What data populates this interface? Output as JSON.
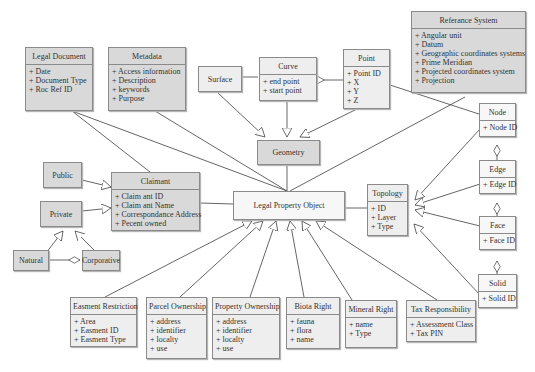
{
  "diagram": {
    "type": "UML class diagram",
    "classes": {
      "legal_document": {
        "name": "Legal Document",
        "attributes": [
          "+ Date",
          "+ Document Type",
          "+ Roc Ref ID"
        ]
      },
      "metadata": {
        "name": "Metadata",
        "attributes": [
          "+ Access information",
          "+ Description",
          "+ keywords",
          "+ Purpose"
        ]
      },
      "surface": {
        "name": "Surface",
        "attributes": []
      },
      "curve": {
        "name": "Curve",
        "attributes": [
          "+ end point",
          "+ start point"
        ]
      },
      "point": {
        "name": "Point",
        "attributes": [
          "+ Point ID",
          "+ X",
          "+ Y",
          "+ Z"
        ]
      },
      "reference_system": {
        "name": "Referance System",
        "attributes": [
          "+ Angular unit",
          "+ Datum",
          "+ Geographic coordinates systems",
          "+ Prime Meridian",
          "+ Projected coordinates system",
          "+ Projection"
        ]
      },
      "node": {
        "name": "Node",
        "attributes": [
          "+ Node ID"
        ]
      },
      "edge": {
        "name": "Edge",
        "attributes": [
          "+ Edge ID"
        ]
      },
      "face": {
        "name": "Face",
        "attributes": [
          "+ Face ID"
        ]
      },
      "solid": {
        "name": "Solid",
        "attributes": [
          "+ Solid ID"
        ]
      },
      "geometry": {
        "name": "Geometry",
        "attributes": []
      },
      "topology": {
        "name": "Topology",
        "attributes": [
          "+ ID",
          "+ Layer",
          "+ Type"
        ]
      },
      "public": {
        "name": "Public",
        "attributes": []
      },
      "private": {
        "name": "Private",
        "attributes": []
      },
      "natural": {
        "name": "Natural",
        "attributes": []
      },
      "corporative": {
        "name": "Corporative",
        "attributes": []
      },
      "claimant": {
        "name": "Claimant",
        "attributes": [
          "+ Claim ant ID",
          "+ Claim ant Name",
          "+ Correspondance Address",
          "+ Pecent owned"
        ]
      },
      "legal_property_object": {
        "name": "Legal Property Object",
        "attributes": []
      },
      "easement_restriction": {
        "name": "Easment Restriction",
        "attributes": [
          "+ Area",
          "+ Easment ID",
          "+ Easment Type"
        ]
      },
      "parcel_ownership": {
        "name": "Parcel Ownership",
        "attributes": [
          "+ address",
          "+ identifier",
          "+ localty",
          "+ use"
        ]
      },
      "property_ownership": {
        "name": "Property Ownership",
        "attributes": [
          "+ address",
          "+ identifier",
          "+ localty",
          "+ use"
        ]
      },
      "biota_right": {
        "name": "Biota Right",
        "attributes": [
          "+ fauna",
          "+ flora",
          "+ name"
        ]
      },
      "mineral_right": {
        "name": "Mineral Right",
        "attributes": [
          "+ name",
          "+ Type"
        ]
      },
      "tax_responsibility": {
        "name": "Tax Responsibility",
        "attributes": [
          "+ Assessment Class",
          "+ Tax PIN"
        ]
      }
    },
    "relationships": [
      {
        "from": "Surface",
        "to": "Curve",
        "type": "aggregation"
      },
      {
        "from": "Curve",
        "to": "Point",
        "type": "aggregation"
      },
      {
        "from": "Surface",
        "to": "Geometry",
        "type": "generalization"
      },
      {
        "from": "Curve",
        "to": "Geometry",
        "type": "generalization"
      },
      {
        "from": "Point",
        "to": "Geometry",
        "type": "generalization"
      },
      {
        "from": "Point",
        "to": "Node",
        "type": "association"
      },
      {
        "from": "Referance System",
        "to": "Legal Property Object",
        "type": "association"
      },
      {
        "from": "Node",
        "to": "Edge",
        "type": "aggregation"
      },
      {
        "from": "Edge",
        "to": "Face",
        "type": "aggregation"
      },
      {
        "from": "Face",
        "to": "Solid",
        "type": "aggregation"
      },
      {
        "from": "Node",
        "to": "Topology",
        "type": "generalization"
      },
      {
        "from": "Edge",
        "to": "Topology",
        "type": "generalization"
      },
      {
        "from": "Face",
        "to": "Topology",
        "type": "generalization"
      },
      {
        "from": "Solid",
        "to": "Topology",
        "type": "generalization"
      },
      {
        "from": "Geometry",
        "to": "Legal Property Object",
        "type": "association"
      },
      {
        "from": "Legal Document",
        "to": "Legal Property Object",
        "type": "association"
      },
      {
        "from": "Metadata",
        "to": "Legal Property Object",
        "type": "association"
      },
      {
        "from": "Legal Document",
        "to": "Claimant",
        "type": "association"
      },
      {
        "from": "Claimant",
        "to": "Legal Property Object",
        "type": "association"
      },
      {
        "from": "Legal Property Object",
        "to": "Topology",
        "type": "association"
      },
      {
        "from": "Public",
        "to": "Claimant",
        "type": "generalization"
      },
      {
        "from": "Private",
        "to": "Claimant",
        "type": "generalization"
      },
      {
        "from": "Natural",
        "to": "Private",
        "type": "generalization"
      },
      {
        "from": "Corporative",
        "to": "Private",
        "type": "generalization"
      },
      {
        "from": "Natural",
        "to": "Corporative",
        "type": "aggregation"
      },
      {
        "from": "Easment Restriction",
        "to": "Legal Property Object",
        "type": "generalization"
      },
      {
        "from": "Parcel Ownership",
        "to": "Legal Property Object",
        "type": "generalization"
      },
      {
        "from": "Property Ownership",
        "to": "Legal Property Object",
        "type": "generalization"
      },
      {
        "from": "Biota Right",
        "to": "Legal Property Object",
        "type": "generalization"
      },
      {
        "from": "Mineral Right",
        "to": "Legal Property Object",
        "type": "generalization"
      },
      {
        "from": "Tax Responsibility",
        "to": "Legal Property Object",
        "type": "generalization"
      }
    ]
  },
  "colors": {
    "box_dark": "#d9d9d9",
    "box_light": "#eeeeee",
    "box_white": "#f7f7f7",
    "line": "#555555",
    "border": "#8a8a8a"
  }
}
